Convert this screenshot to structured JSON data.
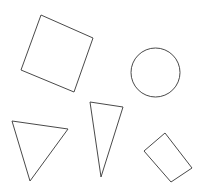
{
  "canvas": {
    "width": 203,
    "height": 190,
    "background_color": "#ffffff",
    "stroke_color": "#4a4a4a",
    "stroke_width": 1,
    "fill": "none"
  },
  "shapes": [
    {
      "id": "square",
      "name": "rotated-square",
      "type": "polygon",
      "label": "Rotated square",
      "points": "41,15 93,38 74,92 21,70"
    },
    {
      "id": "circle",
      "name": "circle",
      "type": "circle",
      "label": "Circle",
      "cx": 155.5,
      "cy": 72.5,
      "r": 24.5
    },
    {
      "id": "triangle-left",
      "name": "wide-triangle",
      "type": "polygon",
      "label": "Wide triangle",
      "points": "12,121 68,129 30,181"
    },
    {
      "id": "triangle-middle",
      "name": "narrow-triangle",
      "type": "polygon",
      "label": "Narrow triangle",
      "points": "90,102 123,107 101,177"
    },
    {
      "id": "rectangle",
      "name": "rotated-rectangle",
      "type": "polygon",
      "label": "Rotated rectangle",
      "points": "165,133 192,168 171,182 144,151"
    }
  ]
}
